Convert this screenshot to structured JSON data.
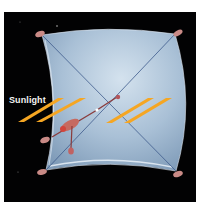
{
  "diagram": {
    "labels": {
      "sunlight": "Sunlight"
    },
    "colors": {
      "background": "#020203",
      "sail": "#a9c0d6",
      "sail_highlight": "#cfdeec",
      "rigging": "#3e5a8c",
      "sunlight_arrows": "#f5a623",
      "spacecraft": "#c0605a"
    }
  }
}
